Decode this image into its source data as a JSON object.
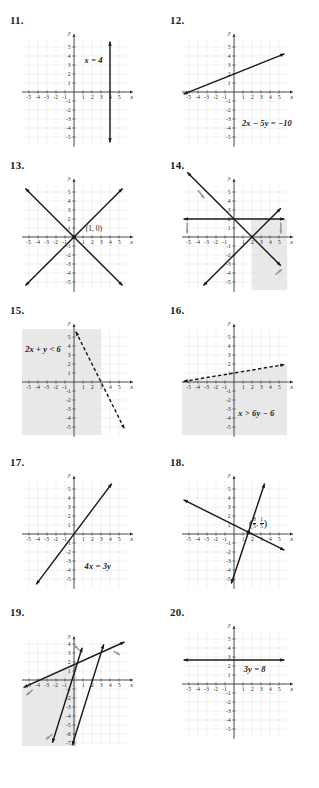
{
  "page": {
    "axis_labels": {
      "x": "x",
      "y": "y"
    },
    "x_ticks_negative": [
      "-5",
      "-4",
      "-3",
      "-2",
      "-1"
    ],
    "x_ticks_positive": [
      "1",
      "2",
      "3",
      "4",
      "5"
    ],
    "y_ticks_positive": [
      "1",
      "2",
      "3",
      "4",
      "5"
    ],
    "y_ticks_negative": [
      "-1",
      "-2",
      "-3",
      "-4",
      "-5"
    ],
    "y_ticks_negative_extended": [
      "-1",
      "-2",
      "-3",
      "-4",
      "-5",
      "-6",
      "-7"
    ],
    "colors": {
      "ink": "#1a1a1a",
      "grid": "#e2e2e2",
      "axis": "#3a3a3a",
      "shade": "#e9e9e9",
      "shade_arrow": "#9a9a9a",
      "paper": "#ffffff"
    }
  },
  "problems": [
    {
      "number": "11.",
      "equation": "x = 4",
      "type": "vertical-line",
      "chart_data": {
        "type": "line",
        "title": "x = 4",
        "xlabel": "x",
        "ylabel": "y",
        "xlim": [
          -6,
          6
        ],
        "ylim": [
          -6,
          6
        ],
        "grid": true,
        "series": [
          {
            "name": "x = 4",
            "style": "solid",
            "arrows": "both",
            "points": [
              [
                4,
                -5.6
              ],
              [
                4,
                5.6
              ]
            ]
          }
        ],
        "shading": "none",
        "annotations": [
          {
            "text": "x = 4",
            "x": 1.4,
            "y": 3.5
          }
        ]
      }
    },
    {
      "number": "12.",
      "equation": "2x − 5y = −10",
      "type": "line",
      "chart_data": {
        "type": "line",
        "title": "2x − 5y = −10",
        "xlabel": "x",
        "ylabel": "y",
        "xlim": [
          -6,
          6
        ],
        "ylim": [
          -6,
          6
        ],
        "grid": true,
        "series": [
          {
            "name": "2x - 5y = -10",
            "style": "solid",
            "arrows": "both",
            "slope": 0.4,
            "intercept": 2,
            "points": [
              [
                -5.6,
                -0.24
              ],
              [
                5.6,
                4.24
              ]
            ]
          }
        ],
        "shading": "none",
        "annotations": [
          {
            "text": "2x − 5y = −10",
            "x": 1.1,
            "y": -3.6
          }
        ]
      }
    },
    {
      "number": "13.",
      "equation": "",
      "point_label": "(1, 0)",
      "type": "system-two-lines",
      "chart_data": {
        "type": "line",
        "title": "",
        "xlabel": "x",
        "ylabel": "y",
        "xlim": [
          -6,
          6
        ],
        "ylim": [
          -6,
          6
        ],
        "grid": true,
        "series": [
          {
            "name": "line-a",
            "style": "solid",
            "arrows": "both",
            "slope": 1,
            "points": [
              [
                -5.4,
                -5.4
              ],
              [
                5.4,
                5.4
              ]
            ]
          },
          {
            "name": "line-b",
            "style": "solid",
            "arrows": "both",
            "slope": -1,
            "points": [
              [
                -5.4,
                5.4
              ],
              [
                5.4,
                -5.4
              ]
            ]
          }
        ],
        "shading": "none",
        "intersection": [
          0,
          0
        ],
        "annotations": [
          {
            "text": "(1, 0)",
            "x": 1.3,
            "y": 0.75
          }
        ]
      }
    },
    {
      "number": "14.",
      "equation": "",
      "type": "system-inequalities",
      "chart_data": {
        "type": "line",
        "title": "",
        "xlabel": "x",
        "ylabel": "y",
        "xlim": [
          -6,
          6
        ],
        "ylim": [
          -6,
          6
        ],
        "grid": true,
        "series": [
          {
            "name": "boundary-down",
            "style": "solid",
            "arrows": "both",
            "slope": -1,
            "intercept": 2,
            "points": [
              [
                -5.2,
                7.2
              ],
              [
                5.2,
                -3.2
              ]
            ]
          },
          {
            "name": "boundary-up",
            "style": "solid",
            "arrows": "both",
            "slope": 1,
            "intercept": -2,
            "points": [
              [
                -3.4,
                -5.4
              ],
              [
                5.2,
                3.2
              ]
            ]
          },
          {
            "name": "boundary-horizontal",
            "style": "solid",
            "arrows": "both",
            "slope": 0,
            "intercept": 2,
            "points": [
              [
                -5.6,
                2
              ],
              [
                5.6,
                2
              ]
            ]
          }
        ],
        "shading": "region-right",
        "shade_arrows": 4
      }
    },
    {
      "number": "15.",
      "equation": "2x + y < 6",
      "type": "inequality",
      "chart_data": {
        "type": "line",
        "title": "2x + y < 6",
        "xlabel": "x",
        "ylabel": "y",
        "xlim": [
          -6,
          6
        ],
        "ylim": [
          -6,
          6
        ],
        "grid": true,
        "series": [
          {
            "name": "2x + y = 6",
            "style": "dashed",
            "arrows": "both",
            "slope": -2,
            "intercept": 6,
            "points": [
              [
                0.2,
                5.6
              ],
              [
                5.6,
                -5.2
              ]
            ]
          }
        ],
        "shading": "left-of-line",
        "annotations": [
          {
            "text": "2x + y < 6",
            "x": -5.2,
            "y": 3.6
          }
        ]
      }
    },
    {
      "number": "16.",
      "equation": "x > 6y − 6",
      "type": "inequality",
      "chart_data": {
        "type": "line",
        "title": "x > 6y − 6",
        "xlabel": "x",
        "ylabel": "y",
        "xlim": [
          -6,
          6
        ],
        "ylim": [
          -6,
          6
        ],
        "grid": true,
        "series": [
          {
            "name": "x = 6y - 6",
            "style": "dashed",
            "arrows": "both",
            "slope": 0.1667,
            "intercept": 1,
            "points": [
              [
                -5.6,
                0.07
              ],
              [
                5.6,
                1.93
              ]
            ]
          }
        ],
        "shading": "below-line",
        "annotations": [
          {
            "text": "x > 6y − 6",
            "x": 0.7,
            "y": -3.6
          }
        ]
      }
    },
    {
      "number": "17.",
      "equation": "4x = 3y",
      "type": "line",
      "chart_data": {
        "type": "line",
        "title": "4x = 3y",
        "xlabel": "x",
        "ylabel": "y",
        "xlim": [
          -6,
          6
        ],
        "ylim": [
          -6,
          6
        ],
        "grid": true,
        "series": [
          {
            "name": "4x = 3y",
            "style": "solid",
            "arrows": "both",
            "slope": 1.3333,
            "intercept": 0,
            "points": [
              [
                -4.2,
                -5.6
              ],
              [
                4.2,
                5.6
              ]
            ]
          }
        ],
        "shading": "none",
        "annotations": [
          {
            "text": "4x = 3y",
            "x": 1.4,
            "y": -3.7
          }
        ]
      }
    },
    {
      "number": "18.",
      "equation": "",
      "point_label_parts": {
        "x_num": "8",
        "x_den": "5",
        "y_num": "1",
        "y_den": "5"
      },
      "type": "system-two-lines",
      "chart_data": {
        "type": "line",
        "title": "",
        "xlabel": "x",
        "ylabel": "y",
        "xlim": [
          -6,
          6
        ],
        "ylim": [
          -6,
          6
        ],
        "grid": true,
        "series": [
          {
            "name": "steep-line",
            "style": "solid",
            "arrows": "both",
            "slope": 3,
            "intercept": -4.6,
            "points": [
              [
                -0.3,
                -5.5
              ],
              [
                3.4,
                5.6
              ]
            ]
          },
          {
            "name": "shallow-line",
            "style": "solid",
            "arrows": "both",
            "slope": -0.5,
            "intercept": 1,
            "points": [
              [
                -5.6,
                3.8
              ],
              [
                5.6,
                -1.8
              ]
            ]
          }
        ],
        "shading": "none",
        "intersection": [
          1.6,
          0.2
        ],
        "annotations": [
          {
            "text": "(8/5, 1/5)",
            "x": 2.1,
            "y": 1.1
          }
        ]
      }
    },
    {
      "number": "19.",
      "equation": "",
      "type": "system-inequalities",
      "y_axis_extended": true,
      "chart_data": {
        "type": "line",
        "title": "",
        "xlabel": "x",
        "ylabel": "y",
        "xlim": [
          -6,
          6
        ],
        "ylim": [
          -8,
          4
        ],
        "grid": true,
        "series": [
          {
            "name": "shallow-line",
            "style": "solid",
            "arrows": "both",
            "slope": 0.45,
            "intercept": 1.7,
            "points": [
              [
                -5.6,
                -0.82
              ],
              [
                5.6,
                4.22
              ]
            ]
          },
          {
            "name": "steep-line-a",
            "style": "solid",
            "arrows": "both",
            "slope": 3.2,
            "intercept": 0.7,
            "points": [
              [
                -2.4,
                -6.98
              ],
              [
                0.9,
                3.58
              ]
            ]
          },
          {
            "name": "steep-line-b",
            "style": "solid",
            "arrows": "both",
            "slope": 3.2,
            "intercept": -6.6,
            "points": [
              [
                -0.2,
                -7.24
              ],
              [
                3.3,
                3.96
              ]
            ]
          }
        ],
        "shading": "region-left",
        "shade_arrows": 4
      }
    },
    {
      "number": "20.",
      "equation": "3y = 8",
      "type": "horizontal-line",
      "chart_data": {
        "type": "line",
        "title": "3y = 8",
        "xlabel": "x",
        "ylabel": "y",
        "xlim": [
          -6,
          6
        ],
        "ylim": [
          -6,
          6
        ],
        "grid": true,
        "series": [
          {
            "name": "3y = 8",
            "style": "solid",
            "arrows": "both",
            "slope": 0,
            "intercept": 2.6667,
            "points": [
              [
                -5.6,
                2.6667
              ],
              [
                5.6,
                2.6667
              ]
            ]
          }
        ],
        "shading": "none",
        "annotations": [
          {
            "text": "3y = 8",
            "x": 1.3,
            "y": 1.6
          }
        ]
      }
    }
  ]
}
